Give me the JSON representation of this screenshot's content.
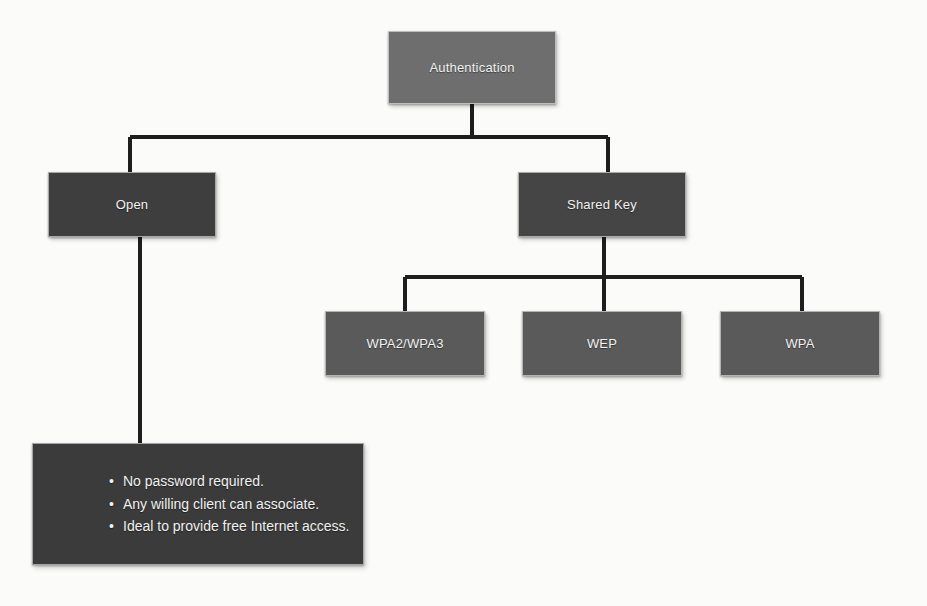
{
  "diagram": {
    "title_node": "Authentication",
    "type": "tree",
    "palette": {
      "background": "#fbfbfa",
      "line": "#1e1e1e",
      "root_fill": "#6e6e6e",
      "level2_fill": "#3e3e3e",
      "level3_fill": "#585858",
      "notes_fill": "#3b3b3b",
      "text": "#f2f2f2"
    },
    "nodes": [
      {
        "id": "authentication",
        "label": "Authentication",
        "level": 0
      },
      {
        "id": "open",
        "label": "Open",
        "level": 1
      },
      {
        "id": "shared_key",
        "label": "Shared Key",
        "level": 1
      },
      {
        "id": "wpa2_wpa3",
        "label": "WPA2/WPA3",
        "level": 2
      },
      {
        "id": "wep",
        "label": "WEP",
        "level": 2
      },
      {
        "id": "wpa",
        "label": "WPA",
        "level": 2
      }
    ],
    "edges": [
      {
        "from": "authentication",
        "to": "open"
      },
      {
        "from": "authentication",
        "to": "shared_key"
      },
      {
        "from": "shared_key",
        "to": "wpa2_wpa3"
      },
      {
        "from": "shared_key",
        "to": "wep"
      },
      {
        "from": "shared_key",
        "to": "wpa"
      },
      {
        "from": "open",
        "to": "open_notes"
      }
    ],
    "open_notes": {
      "bullet_glyph": "•",
      "items": [
        "No password required.",
        "Any willing client can associate.",
        "Ideal to provide free Internet access."
      ]
    }
  }
}
